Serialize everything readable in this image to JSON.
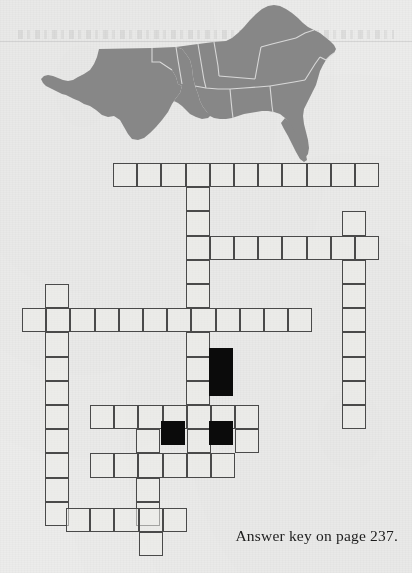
{
  "page": {
    "background_color": "#ececea",
    "width": 412,
    "height": 573
  },
  "map": {
    "name": "southern-united-states-map",
    "fill_color": "#878787",
    "border_color": "#d9d9d9",
    "description": "Shaded map of the southern United States"
  },
  "footer": {
    "answer_key_text": "Answer key on page 237."
  },
  "crossword": {
    "cell_size": 24.2,
    "origin_x": 113.0,
    "origin_y": 163.0,
    "line_color": "#4a4a4a",
    "block_color": "#0b0b0b",
    "entries": [
      {
        "name": "across-1",
        "row": 0,
        "col": 0,
        "length": 11,
        "direction": "across"
      },
      {
        "name": "down-1",
        "row": 1,
        "col": 3,
        "length": 2,
        "direction": "down"
      },
      {
        "name": "across-2",
        "row": 3,
        "col": 3,
        "length": 8,
        "direction": "across"
      },
      {
        "name": "down-2",
        "row": 2,
        "col": 9.5,
        "length": 7,
        "direction": "down"
      },
      {
        "name": "down-3",
        "row": 4,
        "col": 3,
        "length": 4,
        "direction": "down"
      },
      {
        "name": "down-4",
        "row": 5,
        "col": -2.8,
        "length": 9,
        "direction": "down"
      },
      {
        "name": "across-3",
        "row": 6,
        "col": -3.8,
        "length": 12,
        "direction": "across"
      },
      {
        "name": "down-5",
        "row": 7,
        "col": 4,
        "length": 4,
        "direction": "down"
      },
      {
        "name": "across-4",
        "row": 9,
        "col": 0.8,
        "length": 7,
        "direction": "across"
      },
      {
        "name": "across-5",
        "row": 11,
        "col": 0.8,
        "length": 6,
        "direction": "across"
      },
      {
        "name": "down-6",
        "row": 8,
        "col": 1.8,
        "length": 7,
        "direction": "down"
      },
      {
        "name": "across-6",
        "row": 14,
        "col": -1.8,
        "length": 5,
        "direction": "across"
      }
    ],
    "blocks": [
      {
        "name": "block-cell-1",
        "x": 209.0,
        "y": 348.0
      },
      {
        "name": "block-cell-2",
        "x": 209.0,
        "y": 372.0
      },
      {
        "name": "block-cell-3",
        "x": 160.5,
        "y": 420.5
      },
      {
        "name": "block-cell-4",
        "x": 209.0,
        "y": 420.5
      }
    ],
    "cells": [
      {
        "x": 113.0,
        "y": 163.0
      },
      {
        "x": 137.2,
        "y": 163.0
      },
      {
        "x": 161.4,
        "y": 163.0
      },
      {
        "x": 185.6,
        "y": 163.0
      },
      {
        "x": 209.8,
        "y": 163.0
      },
      {
        "x": 234.0,
        "y": 163.0
      },
      {
        "x": 258.2,
        "y": 163.0
      },
      {
        "x": 282.4,
        "y": 163.0
      },
      {
        "x": 306.6,
        "y": 163.0
      },
      {
        "x": 330.8,
        "y": 163.0
      },
      {
        "x": 355.0,
        "y": 163.0
      },
      {
        "x": 185.6,
        "y": 187.2
      },
      {
        "x": 185.6,
        "y": 211.4
      },
      {
        "x": 342.0,
        "y": 211.4
      },
      {
        "x": 185.6,
        "y": 235.6
      },
      {
        "x": 209.8,
        "y": 235.6
      },
      {
        "x": 234.0,
        "y": 235.6
      },
      {
        "x": 258.2,
        "y": 235.6
      },
      {
        "x": 282.4,
        "y": 235.6
      },
      {
        "x": 306.6,
        "y": 235.6
      },
      {
        "x": 330.8,
        "y": 235.6
      },
      {
        "x": 355.0,
        "y": 235.6
      },
      {
        "x": 185.6,
        "y": 259.8
      },
      {
        "x": 342.0,
        "y": 259.8
      },
      {
        "x": 185.6,
        "y": 284.0
      },
      {
        "x": 342.0,
        "y": 284.0
      },
      {
        "x": 45.0,
        "y": 284.0
      },
      {
        "x": 22.0,
        "y": 308.2
      },
      {
        "x": 46.2,
        "y": 308.2
      },
      {
        "x": 70.4,
        "y": 308.2
      },
      {
        "x": 94.6,
        "y": 308.2
      },
      {
        "x": 118.8,
        "y": 308.2
      },
      {
        "x": 143.0,
        "y": 308.2
      },
      {
        "x": 167.2,
        "y": 308.2
      },
      {
        "x": 191.4,
        "y": 308.2
      },
      {
        "x": 215.6,
        "y": 308.2
      },
      {
        "x": 239.8,
        "y": 308.2
      },
      {
        "x": 264.0,
        "y": 308.2
      },
      {
        "x": 288.2,
        "y": 308.2
      },
      {
        "x": 342.0,
        "y": 308.2
      },
      {
        "x": 45.0,
        "y": 332.4
      },
      {
        "x": 185.6,
        "y": 332.4
      },
      {
        "x": 342.0,
        "y": 332.4
      },
      {
        "x": 45.0,
        "y": 356.6
      },
      {
        "x": 185.6,
        "y": 356.6
      },
      {
        "x": 342.0,
        "y": 356.6
      },
      {
        "x": 45.0,
        "y": 380.8
      },
      {
        "x": 185.6,
        "y": 380.8
      },
      {
        "x": 342.0,
        "y": 380.8
      },
      {
        "x": 45.0,
        "y": 405.0
      },
      {
        "x": 90.0,
        "y": 405.0
      },
      {
        "x": 114.2,
        "y": 405.0
      },
      {
        "x": 138.4,
        "y": 405.0
      },
      {
        "x": 162.6,
        "y": 405.0
      },
      {
        "x": 186.8,
        "y": 405.0
      },
      {
        "x": 211.0,
        "y": 405.0
      },
      {
        "x": 235.2,
        "y": 405.0
      },
      {
        "x": 342.0,
        "y": 405.0
      },
      {
        "x": 45.0,
        "y": 429.2
      },
      {
        "x": 136.0,
        "y": 429.2
      },
      {
        "x": 186.8,
        "y": 429.2
      },
      {
        "x": 235.2,
        "y": 429.2
      },
      {
        "x": 45.0,
        "y": 453.4
      },
      {
        "x": 90.0,
        "y": 453.4
      },
      {
        "x": 114.2,
        "y": 453.4
      },
      {
        "x": 138.4,
        "y": 453.4
      },
      {
        "x": 162.6,
        "y": 453.4
      },
      {
        "x": 186.8,
        "y": 453.4
      },
      {
        "x": 211.0,
        "y": 453.4
      },
      {
        "x": 45.0,
        "y": 477.6
      },
      {
        "x": 136.0,
        "y": 477.6
      },
      {
        "x": 45.0,
        "y": 501.8
      },
      {
        "x": 136.0,
        "y": 501.8
      },
      {
        "x": 66.0,
        "y": 508.0
      },
      {
        "x": 90.2,
        "y": 508.0
      },
      {
        "x": 114.4,
        "y": 508.0
      },
      {
        "x": 138.6,
        "y": 508.0
      },
      {
        "x": 162.8,
        "y": 508.0
      },
      {
        "x": 138.6,
        "y": 532.2
      }
    ]
  }
}
